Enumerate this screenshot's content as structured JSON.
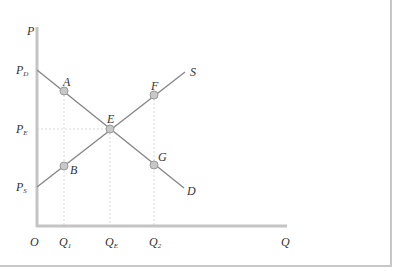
{
  "diagram": {
    "type": "supply-demand",
    "axes": {
      "y_label": "P",
      "x_label": "Q",
      "origin_label": "O"
    },
    "price_labels": [
      {
        "main": "P",
        "sub": "D",
        "y": 70
      },
      {
        "main": "P",
        "sub": "E",
        "y": 129
      },
      {
        "main": "P",
        "sub": "S",
        "y": 187
      }
    ],
    "quantity_labels": [
      {
        "main": "Q",
        "sub": "1",
        "x": 64
      },
      {
        "main": "Q",
        "sub": "E",
        "x": 110
      },
      {
        "main": "Q",
        "sub": "2",
        "x": 154
      }
    ],
    "curves": [
      {
        "name": "D",
        "label": "D",
        "from": [
          37,
          70
        ],
        "to": [
          184,
          188
        ]
      },
      {
        "name": "S",
        "label": "S",
        "from": [
          37,
          187
        ],
        "to": [
          185,
          72
        ]
      }
    ],
    "points": [
      {
        "label": "A",
        "x": 64,
        "y": 91
      },
      {
        "label": "B",
        "x": 64,
        "y": 166
      },
      {
        "label": "E",
        "x": 110,
        "y": 129
      },
      {
        "label": "F",
        "x": 154,
        "y": 95
      },
      {
        "label": "G",
        "x": 154,
        "y": 165
      }
    ],
    "colors": {
      "axis": "#c4c4c4",
      "curve": "#8a8a8a",
      "point_fill": "#c8c8c8",
      "point_stroke": "#9a9a9a",
      "guide": "#d8d8d8",
      "border": "#c8c8c8"
    }
  }
}
